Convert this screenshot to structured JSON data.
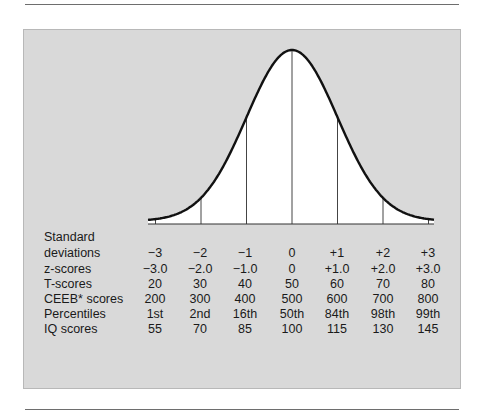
{
  "chart_data": {
    "type": "area",
    "title": "",
    "x": [
      -3,
      -2,
      -1,
      0,
      1,
      2,
      3
    ],
    "xlabel": "Standard deviations",
    "ylabel": "",
    "xlim": [
      -3,
      3
    ],
    "grid": false,
    "legend": "none",
    "rows": [
      {
        "name": "Standard deviations",
        "values": [
          "−3",
          "−2",
          "−1",
          "0",
          "+1",
          "+2",
          "+3"
        ]
      },
      {
        "name": "z-scores",
        "values": [
          "−3.0",
          "−2.0",
          "−1.0",
          "0",
          "+1.0",
          "+2.0",
          "+3.0"
        ]
      },
      {
        "name": "T-scores",
        "values": [
          "20",
          "30",
          "40",
          "50",
          "60",
          "70",
          "80"
        ]
      },
      {
        "name": "CEEB* scores",
        "values": [
          "200",
          "300",
          "400",
          "500",
          "600",
          "700",
          "800"
        ]
      },
      {
        "name": "Percentiles",
        "values": [
          "1st",
          "2nd",
          "16th",
          "50th",
          "84th",
          "98th",
          "99th"
        ]
      },
      {
        "name": "IQ scores",
        "values": [
          "55",
          "70",
          "85",
          "100",
          "115",
          "130",
          "145"
        ]
      }
    ]
  },
  "labels": {
    "sd_line1": "Standard",
    "sd_line2": "deviations",
    "z": "z-scores",
    "t": "T-scores",
    "ceeb": "CEEB* scores",
    "pct": "Percentiles",
    "iq": "IQ scores"
  },
  "columns": [
    {
      "sd": "−3",
      "z": "−3.0",
      "t": "20",
      "ceeb": "200",
      "pct": "1st",
      "iq": "55"
    },
    {
      "sd": "−2",
      "z": "−2.0",
      "t": "30",
      "ceeb": "300",
      "pct": "2nd",
      "iq": "70"
    },
    {
      "sd": "−1",
      "z": "−1.0",
      "t": "40",
      "ceeb": "400",
      "pct": "16th",
      "iq": "85"
    },
    {
      "sd": "0",
      "z": "0",
      "t": "50",
      "ceeb": "500",
      "pct": "50th",
      "iq": "100"
    },
    {
      "sd": "+1",
      "z": "+1.0",
      "t": "60",
      "ceeb": "600",
      "pct": "84th",
      "iq": "115"
    },
    {
      "sd": "+2",
      "z": "+2.0",
      "t": "70",
      "ceeb": "700",
      "pct": "98th",
      "iq": "130"
    },
    {
      "sd": "+3",
      "z": "+3.0",
      "t": "80",
      "ceeb": "800",
      "pct": "99th",
      "iq": "145"
    }
  ],
  "colors": {
    "panel": "#d9d9d9",
    "curve": "#111111",
    "fill": "#ffffff"
  }
}
